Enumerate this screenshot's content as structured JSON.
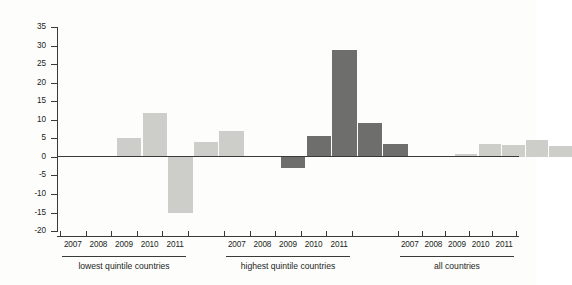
{
  "chart_data": {
    "type": "bar",
    "title": "",
    "subtitle": "",
    "xlabel": "",
    "ylabel": "% change",
    "ylim": [
      -20,
      35
    ],
    "ytick_values": [
      35,
      30,
      25,
      20,
      15,
      10,
      5,
      0,
      -5,
      -10,
      -15,
      -20
    ],
    "ytick_labels": [
      "35",
      "30",
      "25",
      "20",
      "15",
      "10",
      "5",
      "0",
      "-5",
      "-10",
      "-15",
      "-20"
    ],
    "grid": false,
    "legend": "none",
    "categories": [
      "2007",
      "2008",
      "2009",
      "2010",
      "2011"
    ],
    "groups": [
      {
        "name": "lowest quintile countries",
        "color": "#cdcdc9",
        "categories": [
          "2007",
          "2008",
          "2009",
          "2010",
          "2011"
        ],
        "values": [
          5.2,
          11.7,
          -15.2,
          4.0,
          7.1
        ]
      },
      {
        "name": "highest quintile countries",
        "color": "#6e6e6c",
        "categories": [
          "2007",
          "2008",
          "2009",
          "2010",
          "2011"
        ],
        "values": [
          -3.0,
          5.7,
          28.7,
          9.2,
          3.4
        ]
      },
      {
        "name": "all countries",
        "color": "#cdcdc9",
        "categories": [
          "2007",
          "2008",
          "2009",
          "2010",
          "2011"
        ],
        "values": [
          0.8,
          3.6,
          3.3,
          4.5,
          3.0
        ]
      }
    ],
    "series": [
      {
        "name": "lowest quintile countries",
        "values": [
          5.2,
          11.7,
          -15.2,
          4.0,
          7.1
        ]
      },
      {
        "name": "highest quintile countries",
        "values": [
          -3.0,
          5.7,
          28.7,
          9.2,
          3.4
        ]
      },
      {
        "name": "all countries",
        "values": [
          0.8,
          3.6,
          3.3,
          4.5,
          3.0
        ]
      }
    ],
    "axis_color": "#3a3a38",
    "background": "#fdfdfc"
  },
  "yaxis": {
    "label": "% change",
    "ticks": [
      "35",
      "30",
      "25",
      "20",
      "15",
      "10",
      "5",
      "0",
      "-5",
      "-10",
      "-15",
      "-20"
    ]
  }
}
